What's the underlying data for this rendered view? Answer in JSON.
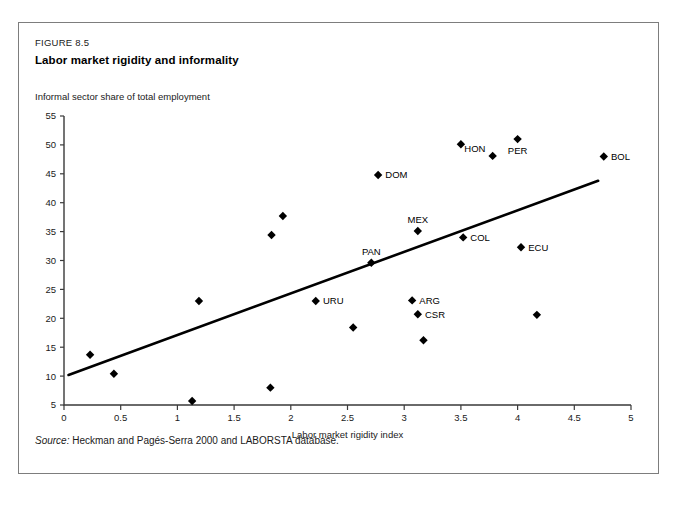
{
  "figure": {
    "number": "FIGURE 8.5",
    "title": "Labor market rigidity and informality",
    "source_label": "Source:",
    "source_text": " Heckman and Pagés-Serra 2000 and LABORSTA database."
  },
  "chart_data": {
    "type": "scatter",
    "title": "Labor market rigidity and informality",
    "subtitle": "Informal sector share of total employment",
    "xlabel": "Labor market rigidity index",
    "ylabel": "Informal sector share of total employment",
    "xlim": [
      0,
      5
    ],
    "ylim": [
      5,
      55
    ],
    "xticks": [
      0,
      0.5,
      1,
      1.5,
      2,
      2.5,
      3,
      3.5,
      4,
      4.5,
      5
    ],
    "xtick_labels": [
      "0",
      "0.5",
      "1",
      "1.5",
      "2",
      "2.5",
      "3",
      "3.5",
      "4",
      "4.5",
      "5"
    ],
    "yticks": [
      5,
      10,
      15,
      20,
      25,
      30,
      35,
      40,
      45,
      50,
      55
    ],
    "ytick_labels": [
      "5",
      "10",
      "15",
      "20",
      "25",
      "30",
      "35",
      "40",
      "45",
      "50",
      "55"
    ],
    "grid": false,
    "legend": "none",
    "points": [
      {
        "label": "",
        "x": 0.23,
        "y": 13.7,
        "label_pos": "right"
      },
      {
        "label": "",
        "x": 0.44,
        "y": 10.4,
        "label_pos": "right"
      },
      {
        "label": "",
        "x": 1.13,
        "y": 5.7,
        "label_pos": "right"
      },
      {
        "label": "",
        "x": 1.19,
        "y": 23.0,
        "label_pos": "right"
      },
      {
        "label": "",
        "x": 1.82,
        "y": 8.0,
        "label_pos": "right"
      },
      {
        "label": "",
        "x": 1.83,
        "y": 34.4,
        "label_pos": "right"
      },
      {
        "label": "",
        "x": 1.93,
        "y": 37.7,
        "label_pos": "right"
      },
      {
        "label": "URU",
        "x": 2.22,
        "y": 23.0,
        "label_pos": "right"
      },
      {
        "label": "",
        "x": 2.55,
        "y": 18.4,
        "label_pos": "right"
      },
      {
        "label": "PAN",
        "x": 2.71,
        "y": 29.6,
        "label_pos": "above"
      },
      {
        "label": "DOM",
        "x": 2.77,
        "y": 44.8,
        "label_pos": "right"
      },
      {
        "label": "ARG",
        "x": 3.07,
        "y": 23.1,
        "label_pos": "right"
      },
      {
        "label": "CSR",
        "x": 3.12,
        "y": 20.7,
        "label_pos": "right"
      },
      {
        "label": "MEX",
        "x": 3.12,
        "y": 35.1,
        "label_pos": "above"
      },
      {
        "label": "",
        "x": 3.17,
        "y": 16.2,
        "label_pos": "right"
      },
      {
        "label": "",
        "x": 3.5,
        "y": 50.1,
        "label_pos": "right"
      },
      {
        "label": "COL",
        "x": 3.52,
        "y": 34.0,
        "label_pos": "right"
      },
      {
        "label": "HON",
        "x": 3.78,
        "y": 48.1,
        "label_pos": "above-left"
      },
      {
        "label": "PER",
        "x": 4.0,
        "y": 51.0,
        "label_pos": "below"
      },
      {
        "label": "ECU",
        "x": 4.03,
        "y": 32.3,
        "label_pos": "right"
      },
      {
        "label": "",
        "x": 4.17,
        "y": 20.6,
        "label_pos": "right"
      },
      {
        "label": "BOL",
        "x": 4.76,
        "y": 48.0,
        "label_pos": "right"
      }
    ],
    "trend_line": {
      "x0": 0.04,
      "y0": 10.2,
      "x1": 4.71,
      "y1": 43.8
    }
  }
}
